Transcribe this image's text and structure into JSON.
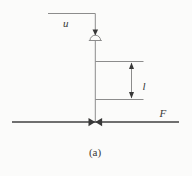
{
  "figure": {
    "caption": "(a)",
    "labels": {
      "u": "u",
      "l": "l",
      "f": "F"
    },
    "icons": {
      "control-signal-arrowhead": "small filled down-triangle ▼",
      "actuator-dome": "half-circle dome over pipe",
      "valve": "bowtie of two filled triangles ►◄",
      "level-dimension-arrow": "double-headed vertical arrow ↕"
    },
    "colors": {
      "line": "#8c8c8c",
      "flow_line": "#6f6f6f",
      "ink": "#383838",
      "background": "#fbfbfa"
    }
  }
}
